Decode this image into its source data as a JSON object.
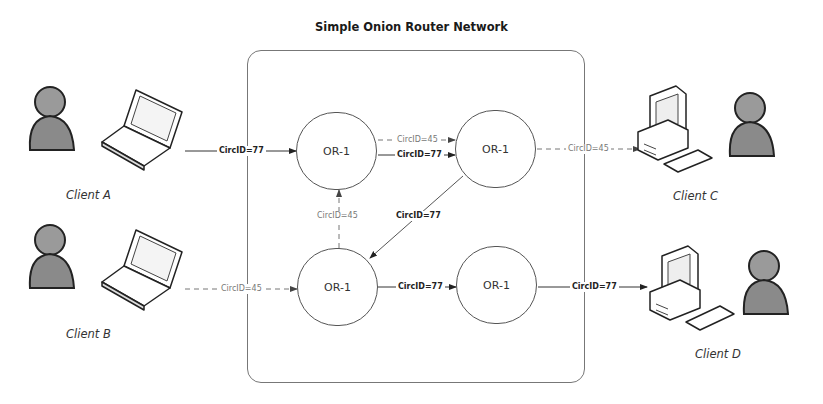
{
  "title": "Simple Onion Router Network",
  "nodes": [
    {
      "id": "or-top-left",
      "label": "OR-1"
    },
    {
      "id": "or-top-right",
      "label": "OR-1"
    },
    {
      "id": "or-bottom-left",
      "label": "OR-1"
    },
    {
      "id": "or-bottom-right",
      "label": "OR-1"
    }
  ],
  "clients": [
    {
      "id": "client-a",
      "label": "Client A",
      "device": "laptop"
    },
    {
      "id": "client-b",
      "label": "Client B",
      "device": "laptop"
    },
    {
      "id": "client-c",
      "label": "Client C",
      "device": "desktop"
    },
    {
      "id": "client-d",
      "label": "Client D",
      "device": "desktop"
    }
  ],
  "edges": [
    {
      "from": "client-a",
      "to": "or-top-left",
      "label": "CircID=77",
      "style": "solid"
    },
    {
      "from": "or-top-left",
      "to": "or-top-right",
      "label": "CircID=45",
      "style": "dashed"
    },
    {
      "from": "or-top-left",
      "to": "or-top-right",
      "label": "CircID=77",
      "style": "solid"
    },
    {
      "from": "or-top-right",
      "to": "client-c",
      "label": "CircID=45",
      "style": "dashed"
    },
    {
      "from": "or-bottom-left",
      "to": "or-top-left",
      "label": "CircID=45",
      "style": "dashed"
    },
    {
      "from": "or-top-right",
      "to": "or-bottom-left",
      "label": "CircID=77",
      "style": "solid"
    },
    {
      "from": "client-b",
      "to": "or-bottom-left",
      "label": "CircID=45",
      "style": "dashed"
    },
    {
      "from": "or-bottom-left",
      "to": "or-bottom-right",
      "label": "CircID=77",
      "style": "solid"
    },
    {
      "from": "or-bottom-right",
      "to": "client-d",
      "label": "CircID=77",
      "style": "solid"
    }
  ],
  "colors": {
    "line": "#333333",
    "dashed_line": "#777777",
    "box": "#777777",
    "person": "#8a8a8a"
  }
}
